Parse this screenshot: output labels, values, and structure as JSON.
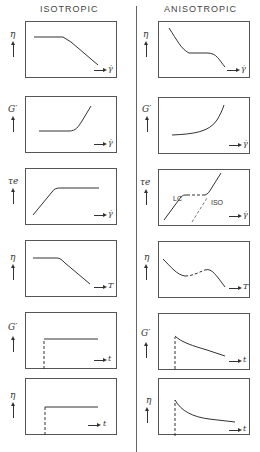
{
  "columns": {
    "left": {
      "title": "ISOTROPIC"
    },
    "right": {
      "title": "ANISOTROPIC"
    }
  },
  "rows": [
    {
      "ylabel": "η",
      "xlabel": "γ̇",
      "left_curve": "plateau-then-shear-thinning",
      "right_curve": "three-region-thinning-plateau-thinning"
    },
    {
      "ylabel": "G′",
      "xlabel": "γ̇",
      "left_curve": "flat-then-linear-rise",
      "right_curve": "monotonic-upward-curve"
    },
    {
      "ylabel": "τe",
      "xlabel": "γ̇",
      "left_curve": "linear-rise-then-plateau",
      "right_curve": "LC-rise-plateau-dashed-ISO-branch",
      "annotations": [
        "LC",
        "ISO"
      ]
    },
    {
      "ylabel": "η",
      "xlabel": "T",
      "left_curve": "plateau-then-decrease",
      "right_curve": "decrease-dashed-bump-decrease"
    },
    {
      "ylabel": "G′",
      "xlabel": "t",
      "left_curve": "step-at-dashed-onset-flat",
      "right_curve": "jump-then-slow-decay"
    },
    {
      "ylabel": "η",
      "xlabel": "t",
      "left_curve": "step-at-dashed-onset-flat",
      "right_curve": "jump-then-exponential-decay"
    }
  ],
  "labels": {
    "lc": "LC",
    "iso": "ISO"
  },
  "colors": {
    "line": "#333333",
    "frame": "#555555"
  }
}
